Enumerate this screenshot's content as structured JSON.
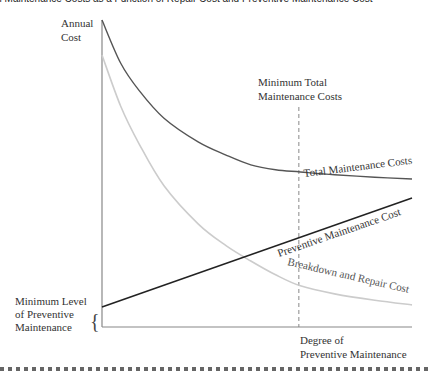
{
  "page": {
    "title": "al Maintenance Costs as a Function of Repair Cost and Preventive Maintenance Cost"
  },
  "chart_data": {
    "type": "line",
    "ylabel": [
      "Annual",
      "Cost"
    ],
    "xlabel": [
      "Degree of",
      "Preventive Maintenance"
    ],
    "xlim": [
      0,
      100
    ],
    "ylim": [
      0,
      100
    ],
    "grid": false,
    "series": [
      {
        "name": "Total Maintenance Costs",
        "color": "#555555",
        "x": [
          0,
          6,
          12,
          20,
          31,
          40,
          48,
          56,
          64,
          75,
          88,
          100
        ],
        "y": [
          100,
          86,
          77,
          68,
          60.3,
          56,
          52.8,
          51.2,
          50.5,
          49.6,
          48.8,
          48.2
        ]
      },
      {
        "name": "Breakdown and Repair Cost",
        "color": "#cccccc",
        "x": [
          0,
          6,
          12,
          20,
          31,
          40,
          48,
          56,
          64,
          75,
          88,
          100
        ],
        "y": [
          88.6,
          72,
          59.6,
          46,
          33.6,
          26.5,
          21.5,
          17,
          13.4,
          10.8,
          8.7,
          7.2
        ]
      },
      {
        "name": "Preventive Maintenance Cost",
        "color": "#222222",
        "x": [
          0,
          100
        ],
        "y": [
          6.5,
          42
        ]
      }
    ],
    "annotations": [
      {
        "text": [
          "Minimum Total",
          "Maintenance Costs"
        ],
        "x": 63.5,
        "type": "vertical-dashed-line"
      },
      {
        "text": [
          "Minimum Level",
          "of Preventive",
          "Maintenance"
        ],
        "y": 6.5,
        "type": "brace"
      }
    ]
  },
  "labels": {
    "y_axis_line1": "Annual",
    "y_axis_line2": "Cost",
    "x_axis_line1": "Degree of",
    "x_axis_line2": "Preventive Maintenance",
    "min_total_line1": "Minimum Total",
    "min_total_line2": "Maintenance Costs",
    "total_curve": "Total Maintenance Costs",
    "preventive_curve": "Preventive Maintenance Cost",
    "breakdown_curve": "Breakdown and Repair Cost",
    "min_level_line1": "Minimum Level",
    "min_level_line2": "of Preventive",
    "min_level_line3": "Maintenance",
    "brace": "{"
  }
}
